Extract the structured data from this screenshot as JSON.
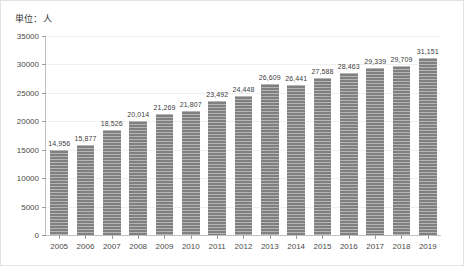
{
  "caption": {
    "unit_label": "単位：人"
  },
  "chart_data": {
    "type": "bar",
    "title": "",
    "subtitle": "",
    "xlabel": "",
    "ylabel": "",
    "unit": "人",
    "categories": [
      "2005",
      "2006",
      "2007",
      "2008",
      "2009",
      "2010",
      "2011",
      "2012",
      "2013",
      "2014",
      "2015",
      "2016",
      "2017",
      "2018",
      "2019"
    ],
    "values": [
      14956,
      15877,
      18526,
      20014,
      21269,
      21807,
      23492,
      24448,
      26609,
      26441,
      27588,
      28463,
      29339,
      29709,
      31151
    ],
    "data_labels": [
      "14,956",
      "15,877",
      "18,526",
      "20,014",
      "21,269",
      "21,807",
      "23,492",
      "24,448",
      "26,609",
      "26,441",
      "27,588",
      "28,463",
      "29,339",
      "29,709",
      "31,151"
    ],
    "ylim": [
      0,
      35000
    ],
    "ytick_values": [
      0,
      5000,
      10000,
      15000,
      20000,
      25000,
      30000,
      35000
    ],
    "ytick_labels": [
      "0",
      "5000",
      "10000",
      "15000",
      "20000",
      "25000",
      "30000",
      "35000"
    ],
    "grid": true,
    "legend": null,
    "legend_position": "none",
    "bar_color": "#808080",
    "bar_pattern": "horizontal-stripes",
    "gridline_color": "#f0f0f0",
    "axis_color": "#bfbfbf",
    "text_color": "#4a4a4a"
  }
}
